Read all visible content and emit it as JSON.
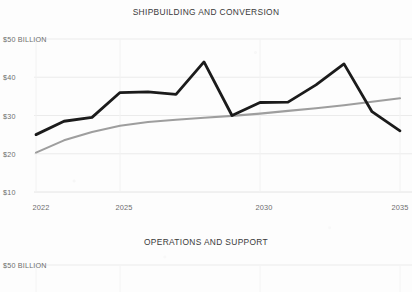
{
  "document": {
    "kind": "scanned-report-page",
    "background_color": "#fdfdfd"
  },
  "charts": {
    "top": {
      "title": "SHIPBUILDING AND CONVERSION",
      "y_axis_top_label": "$50 BILLION",
      "y_ticks": [
        "$50 BILLION",
        "$40",
        "$30",
        "$20",
        "$10"
      ],
      "x_ticks": [
        "2022",
        "2025",
        "2030",
        "2035"
      ]
    },
    "bottom": {
      "title": "OPERATIONS AND SUPPORT",
      "y_axis_top_label": "$50 BILLION"
    }
  },
  "colors": {
    "series_primary": "#1b1b1b",
    "series_secondary": "#9a9a9a",
    "gridline": "#e8e8e8",
    "text": "#5a5a5a"
  },
  "chart_data": [
    {
      "id": "shipbuilding-and-conversion",
      "type": "line",
      "title": "SHIPBUILDING AND CONVERSION",
      "xlabel": "",
      "ylabel": "$50 BILLION",
      "units": "billions of dollars",
      "xlim": [
        2022,
        2035
      ],
      "ylim": [
        10,
        50
      ],
      "yticks": [
        10,
        20,
        30,
        40,
        50
      ],
      "ytick_labels": [
        "$10",
        "$20",
        "$30",
        "$40",
        "$50 BILLION"
      ],
      "xticks": [
        2022,
        2025,
        2030,
        2035
      ],
      "xtick_labels": [
        "2022",
        "2025",
        "2030",
        "2035"
      ],
      "grid": true,
      "legend": "none",
      "x": [
        2022,
        2023,
        2024,
        2025,
        2026,
        2027,
        2028,
        2029,
        2030,
        2031,
        2032,
        2033,
        2034,
        2035
      ],
      "series": [
        {
          "name": "Navy plan",
          "color": "#1b1b1b",
          "values": [
            25.0,
            28.5,
            29.5,
            36.0,
            36.2,
            35.5,
            44.0,
            30.0,
            33.4,
            33.5,
            38.0,
            43.5,
            31.0,
            26.0
          ]
        },
        {
          "name": "Historical average trend",
          "color": "#9a9a9a",
          "values": [
            20.3,
            23.5,
            25.7,
            27.3,
            28.3,
            28.9,
            29.4,
            29.9,
            30.5,
            31.2,
            31.9,
            32.7,
            33.6,
            34.5
          ]
        }
      ]
    },
    {
      "id": "operations-and-support",
      "type": "line",
      "title": "OPERATIONS AND SUPPORT",
      "ylabel": "$50 BILLION",
      "ylim": [
        10,
        50
      ],
      "ytick_labels": [
        "$50 BILLION"
      ],
      "note": "Only the top of this panel is visible; a single dark series rises at the right edge.",
      "x": [
        2032,
        2033,
        2034,
        2035
      ],
      "series": [
        {
          "name": "Navy plan",
          "color": "#1b1b1b",
          "values": [
            38.0,
            41.0,
            43.6,
            44.6
          ]
        }
      ]
    }
  ]
}
